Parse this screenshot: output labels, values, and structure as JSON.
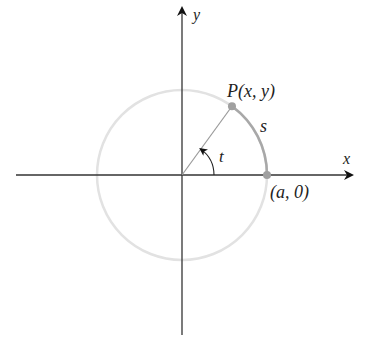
{
  "diagram": {
    "axes": {
      "x_label": "x",
      "y_label": "y"
    },
    "point_P": {
      "label_prefix": "P",
      "label_coords": "(x, y)",
      "angle_deg": 54
    },
    "point_A": {
      "label": "(a, 0)"
    },
    "arc_label": "s",
    "angle_label": "t",
    "colors": {
      "axis": "#333333",
      "circle": "#e2e2e2",
      "arc": "#a8a8a8",
      "point": "#a0a0a0",
      "radius": "#9a9a9a"
    }
  }
}
